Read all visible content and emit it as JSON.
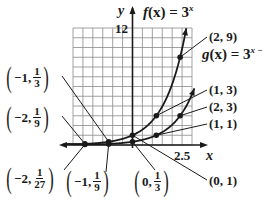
{
  "chart_data": {
    "type": "line",
    "title": "",
    "xlabel": "x",
    "ylabel": "y",
    "x_tick_label": "2.5",
    "y_tick_label": "12",
    "xlim": [
      -2.5,
      2.5
    ],
    "ylim": [
      0,
      12
    ],
    "grid": true,
    "series": [
      {
        "name": "f(x) = 3^x",
        "label_text": "f(x) = 3",
        "exponent": "x",
        "points": [
          {
            "x": -2,
            "y": 0.1111,
            "label": "(-2, 1/9)"
          },
          {
            "x": -1,
            "y": 0.3333,
            "label": "(-1, 1/3)"
          },
          {
            "x": 0,
            "y": 1,
            "label": "(0, 1)"
          },
          {
            "x": 1,
            "y": 3,
            "label": "(1, 3)"
          },
          {
            "x": 2,
            "y": 9,
            "label": "(2, 9)"
          }
        ]
      },
      {
        "name": "g(x) = 3^(x-1)",
        "label_text": "g(x) = 3",
        "exponent": "x −",
        "points": [
          {
            "x": -2,
            "y": 0.037,
            "label": "(-2, 1/27)"
          },
          {
            "x": -1,
            "y": 0.1111,
            "label": "(-1, 1/9)"
          },
          {
            "x": 0,
            "y": 0.3333,
            "label": "(0, 1/3)"
          },
          {
            "x": 1,
            "y": 1,
            "label": "(1, 1)"
          },
          {
            "x": 2,
            "y": 3,
            "label": "(2, 3)"
          }
        ]
      }
    ]
  },
  "labels": {
    "y_axis": "y",
    "x_axis": "x",
    "y_tick": "12",
    "x_tick": "2.5",
    "f_name": "f",
    "f_arg": "(x) = 3",
    "f_exp": "x",
    "g_name": "g",
    "g_arg": "(x) = 3",
    "g_exp": "x −",
    "p_2_9": "(2, 9)",
    "p_1_3": "(1, 3)",
    "p_2_3": "(2, 3)",
    "p_1_1": "(1, 1)",
    "p_0_1": "(0, 1)",
    "m1_third": {
      "pre": "−1,",
      "num": "1",
      "den": "3"
    },
    "m2_ninth": {
      "pre": "−2,",
      "num": "1",
      "den": "9"
    },
    "m2_27": {
      "pre": "−2,",
      "num": "1",
      "den": "27"
    },
    "m1_ninth": {
      "pre": "−1,",
      "num": "1",
      "den": "9"
    },
    "z_third": {
      "pre": "0,",
      "num": "1",
      "den": "3"
    }
  },
  "colors": {
    "ink": "#1a1a1a",
    "grid": "#8a8a8a",
    "background": "#ffffff"
  }
}
